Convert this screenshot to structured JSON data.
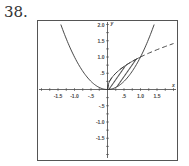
{
  "problem_number": "38.",
  "chart_data": {
    "type": "line",
    "title": "",
    "xlabel": "x",
    "ylabel": "y",
    "xlim": [
      -2,
      2
    ],
    "ylim": [
      -2,
      2
    ],
    "x_ticks": [
      -1.5,
      -1.0,
      -0.5,
      0.5,
      1.0,
      1.5
    ],
    "x_tick_labels": [
      "-1.5",
      "-1.0",
      "-.5",
      ".5",
      "1.0",
      "1.5"
    ],
    "y_ticks": [
      2.0,
      1.5,
      1.0,
      0.5,
      -0.5,
      -1.0,
      -1.5
    ],
    "y_tick_labels": [
      "2.0",
      "1.5",
      "1.0",
      ".5",
      "-.5",
      "-1.0",
      "-1.5"
    ],
    "grid": false,
    "series": [
      {
        "name": "y = x^2",
        "style": "solid",
        "x_range": [
          -1.414,
          1.414
        ]
      },
      {
        "name": "y = sqrt(x)",
        "style": "dashed",
        "x_range": [
          0,
          2
        ]
      }
    ],
    "shaded_region": {
      "between": [
        "y = sqrt(x)",
        "y = x^2"
      ],
      "x_range": [
        0,
        1
      ],
      "pattern": "hatched"
    },
    "intersections": [
      [
        0,
        0
      ],
      [
        1,
        1
      ]
    ]
  }
}
